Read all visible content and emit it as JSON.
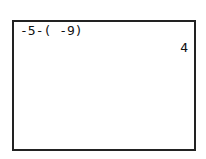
{
  "calculator_screen": {
    "history": [
      {
        "expression": "-5-( -9)",
        "result": "4"
      }
    ]
  }
}
